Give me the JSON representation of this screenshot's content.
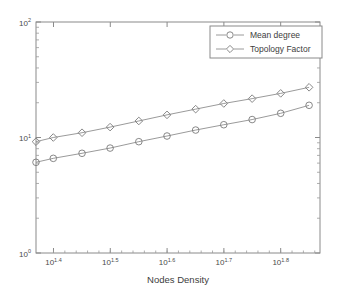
{
  "chart_data": {
    "type": "line",
    "title": "",
    "xlabel": "Nodes Density",
    "ylabel": "",
    "xscale": "log",
    "yscale": "log",
    "xlim": [
      23.4,
      74.0
    ],
    "ylim": [
      1,
      100
    ],
    "grid": false,
    "legend_position": "top-right",
    "x": [
      23.4,
      25.1,
      28.2,
      31.6,
      35.5,
      39.8,
      44.7,
      50.1,
      56.2,
      63.1,
      70.8
    ],
    "xtick_labels": [
      "10^1.4",
      "10^1.5",
      "10^1.6",
      "10^1.7",
      "10^1.8"
    ],
    "xtick_bases": [
      "10",
      "10",
      "10",
      "10",
      "10"
    ],
    "xtick_exponents": [
      "1.4",
      "1.5",
      "1.6",
      "1.7",
      "1.8"
    ],
    "ytick_labels": [
      "10^0",
      "10^1",
      "10^2"
    ],
    "ytick_bases": [
      "10",
      "10",
      "10"
    ],
    "ytick_exponents": [
      "0",
      "1",
      "2"
    ],
    "series": [
      {
        "name": "Mean degree",
        "marker": "circle",
        "values": [
          6.1,
          6.6,
          7.3,
          8.1,
          9.2,
          10.3,
          11.6,
          12.9,
          14.3,
          16.2,
          19.0
        ]
      },
      {
        "name": "Topology Factor",
        "marker": "diamond",
        "values": [
          9.2,
          10.0,
          11.0,
          12.3,
          13.9,
          15.7,
          17.6,
          19.7,
          21.7,
          24.1,
          27.2
        ]
      }
    ]
  },
  "legend": {
    "entries": [
      {
        "label": "Mean degree",
        "marker": "circle"
      },
      {
        "label": "Topology Factor",
        "marker": "diamond"
      }
    ]
  },
  "axes": {
    "x_title": "Nodes Density"
  },
  "colors": {
    "axis": "#8a8a8a",
    "line": "#8e8e8e",
    "marker": "#7a7a7a",
    "text": "#3d3d3d",
    "background": "#ffffff"
  }
}
